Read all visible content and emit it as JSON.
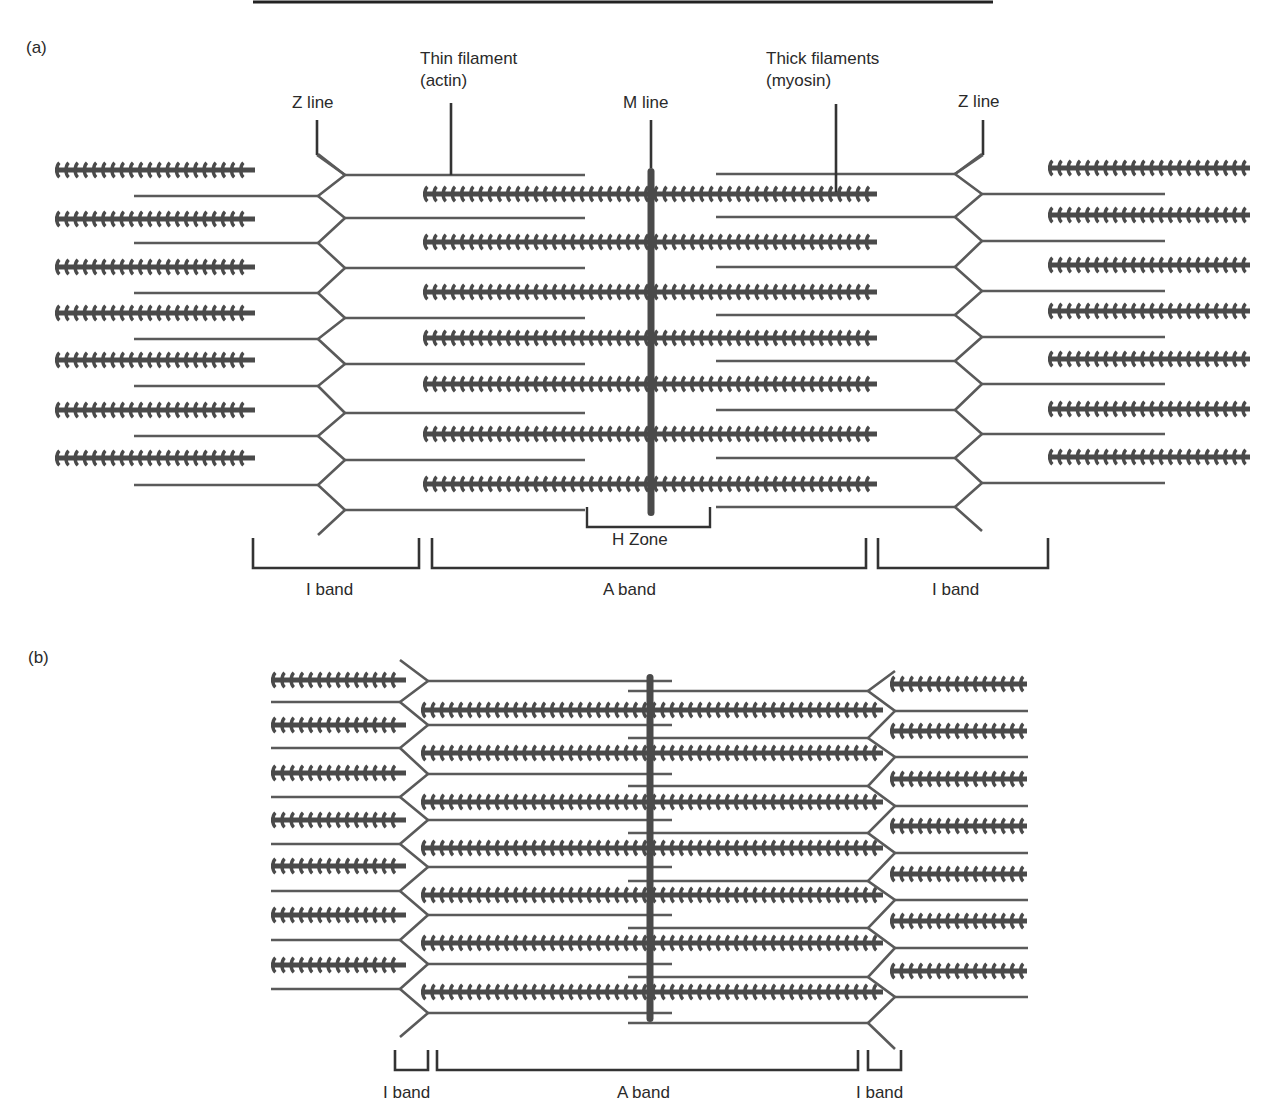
{
  "figure": {
    "top_rule": {
      "x1": 253,
      "x2": 993,
      "y": 2
    },
    "colors": {
      "filament": "#5a5a5a",
      "thick": "#4a4a4a",
      "mline": "#4a4a4a",
      "bracket": "#333333",
      "text": "#2a2a2a",
      "background": "#ffffff"
    }
  },
  "panel_a": {
    "label": "(a)",
    "labels": {
      "z_line_left": "Z line",
      "thin_filament_line1": "Thin filament",
      "thin_filament_line2": "(actin)",
      "m_line": "M line",
      "thick_filaments_line1": "Thick filaments",
      "thick_filaments_line2": "(myosin)",
      "z_line_right": "Z line",
      "h_zone": "H Zone",
      "i_band_left": "I band",
      "a_band": "A band",
      "i_band_right": "I band"
    },
    "geometry": {
      "left_outer_thick": {
        "x1": 55,
        "x2": 255,
        "ys": [
          170,
          219,
          267,
          313,
          360,
          410,
          458
        ]
      },
      "left_outer_thin": {
        "x1": 134,
        "x2": 318,
        "ys": [
          196,
          243,
          293,
          339,
          386,
          436,
          485
        ]
      },
      "left_z_inner_x": 345,
      "left_z_outer_x": 318,
      "left_inner_thin": {
        "x1": 345,
        "x2": 585,
        "ys": [
          175,
          218,
          268,
          318,
          364,
          413,
          460,
          510
        ]
      },
      "thick": {
        "x1": 423,
        "x2": 877,
        "ys": [
          194,
          242,
          292,
          338,
          384,
          434,
          484
        ]
      },
      "m_line": {
        "x": 651,
        "y1": 168,
        "y2": 516
      },
      "right_inner_thin": {
        "x1": 716,
        "x2": 955,
        "ys": [
          174,
          217,
          267,
          315,
          361,
          410,
          458,
          507
        ]
      },
      "right_z_inner_x": 955,
      "right_z_outer_x": 982,
      "right_outer_thin": {
        "x1": 982,
        "x2": 1165,
        "ys": [
          194,
          241,
          291,
          337,
          384,
          434,
          483
        ]
      },
      "right_outer_thick": {
        "x1": 1048,
        "x2": 1250,
        "ys": [
          168,
          215,
          265,
          311,
          359,
          409,
          457
        ]
      },
      "h_zone": {
        "x1": 587,
        "x2": 710,
        "y1": 507,
        "y2": 527
      },
      "brackets": [
        {
          "x1": 253,
          "x2": 419,
          "y1": 538,
          "y2": 568
        },
        {
          "x1": 432,
          "x2": 866,
          "y1": 538,
          "y2": 568
        },
        {
          "x1": 878,
          "x2": 1048,
          "y1": 538,
          "y2": 568
        }
      ]
    }
  },
  "panel_b": {
    "label": "(b)",
    "labels": {
      "i_band_left": "I band",
      "a_band": "A band",
      "i_band_right": "I band"
    },
    "geometry": {
      "left_outer_thick": {
        "x1": 271,
        "x2": 406,
        "ys": [
          680,
          725,
          773,
          820,
          866,
          915,
          965
        ]
      },
      "left_outer_thin": {
        "x1": 271,
        "x2": 400,
        "ys": [
          702,
          748,
          797,
          844,
          891,
          940,
          989
        ]
      },
      "left_z_outer_x": 400,
      "left_z_inner_x": 428,
      "left_inner_thin": {
        "x1": 428,
        "x2": 672,
        "ys": [
          681,
          725,
          774,
          820,
          867,
          915,
          964,
          1013
        ]
      },
      "thick": {
        "x1": 421,
        "x2": 883,
        "ys": [
          710,
          753,
          802,
          848,
          895,
          943,
          992
        ]
      },
      "m_line": {
        "x": 650,
        "y1": 674,
        "y2": 1022
      },
      "right_inner_thin": {
        "x1": 628,
        "x2": 868,
        "ys": [
          691,
          738,
          786,
          833,
          881,
          928,
          977,
          1023
        ]
      },
      "right_z_inner_x": 868,
      "right_z_outer_x": 895,
      "right_outer_thin": {
        "x1": 895,
        "x2": 1028,
        "ys": [
          711,
          757,
          806,
          853,
          900,
          948,
          997
        ]
      },
      "right_outer_thick": {
        "x1": 890,
        "x2": 1027,
        "ys": [
          684,
          731,
          779,
          826,
          874,
          921,
          971
        ]
      },
      "brackets": [
        {
          "x1": 395,
          "x2": 428,
          "y1": 1050,
          "y2": 1070
        },
        {
          "x1": 437,
          "x2": 858,
          "y1": 1050,
          "y2": 1070
        },
        {
          "x1": 868,
          "x2": 901,
          "y1": 1050,
          "y2": 1070
        }
      ]
    }
  }
}
